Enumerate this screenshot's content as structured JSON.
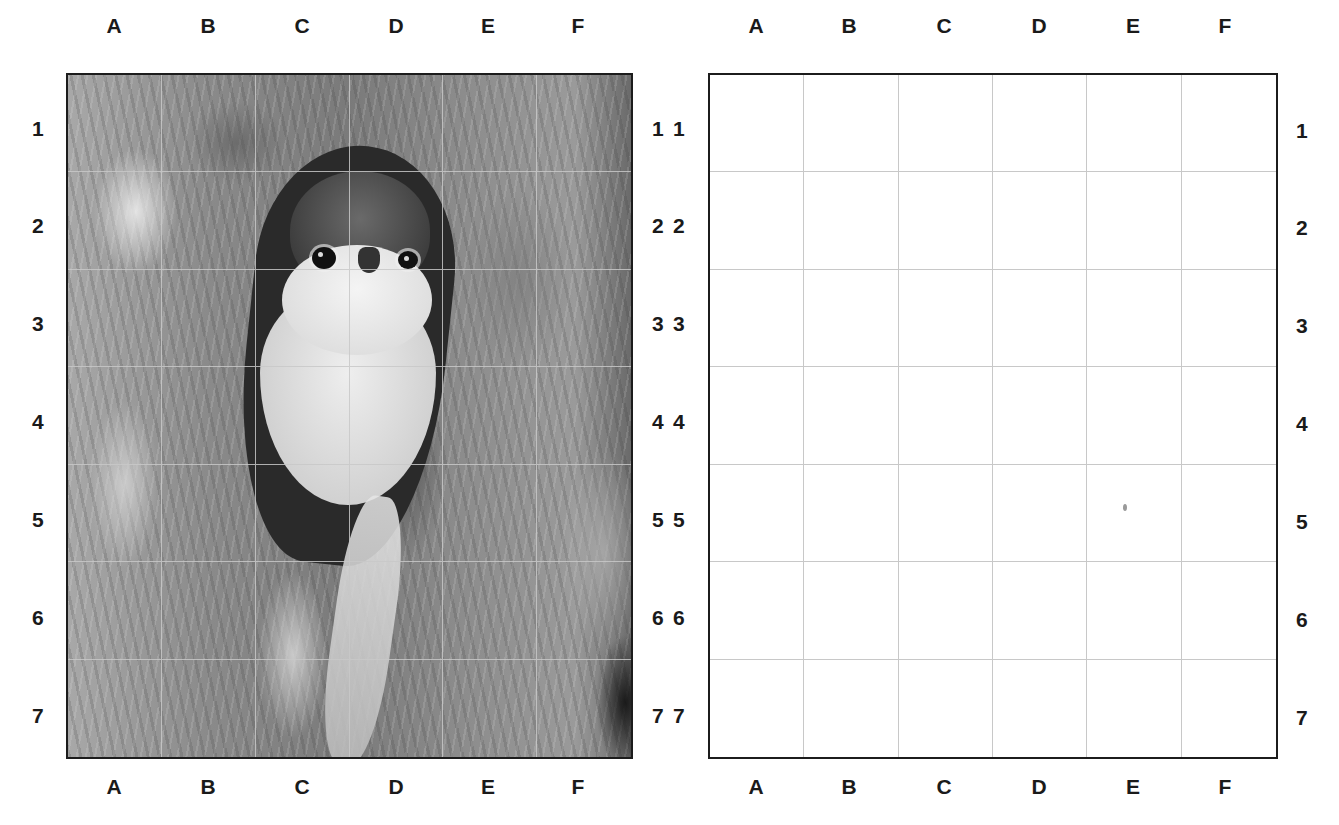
{
  "page": {
    "caption_partial": "... (caption text cut off at top edge) ...",
    "background": "#ffffff"
  },
  "left_grid": {
    "type": "reference-photo",
    "subject": "owl peering out of a tree hollow (black-and-white photo)",
    "columns": [
      "A",
      "B",
      "C",
      "D",
      "E",
      "F"
    ],
    "rows": [
      "1",
      "2",
      "3",
      "4",
      "5",
      "6",
      "7"
    ],
    "border_color": "#1c1c1c",
    "gridline_color": "#c8c8c8"
  },
  "right_grid": {
    "type": "blank-drawing-grid",
    "columns": [
      "A",
      "B",
      "C",
      "D",
      "E",
      "F"
    ],
    "rows": [
      "1",
      "2",
      "3",
      "4",
      "5",
      "6",
      "7"
    ],
    "border_color": "#1c1c1c",
    "gridline_color": "#c8c8c8"
  }
}
